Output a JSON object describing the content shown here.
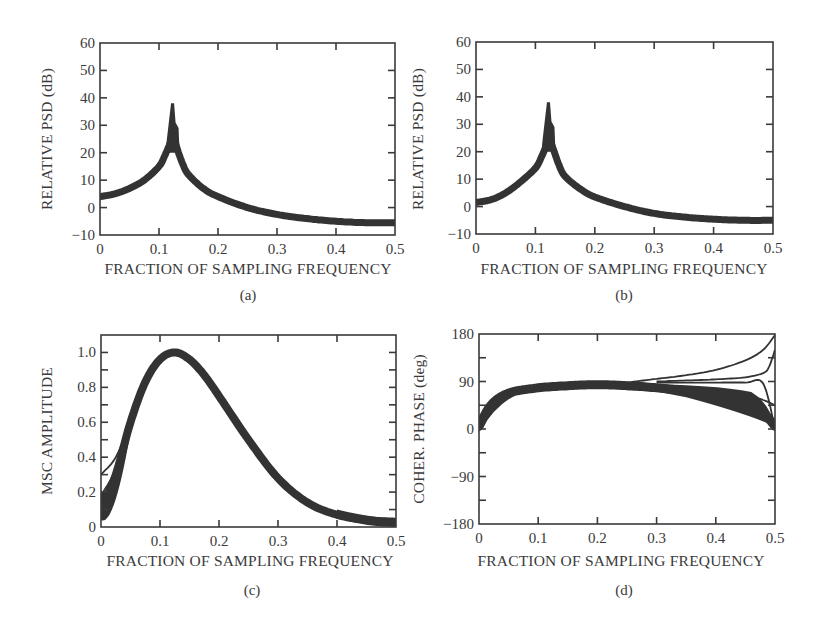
{
  "figure": {
    "panels": [
      {
        "id": "a",
        "caption": "(a)",
        "xlabel": "FRACTION OF SAMPLING FREQUENCY",
        "ylabel": "RELATIVE PSD (dB)"
      },
      {
        "id": "b",
        "caption": "(b)",
        "xlabel": "FRACTION OF SAMPLING FREQUENCY",
        "ylabel": "RELATIVE PSD (dB)"
      },
      {
        "id": "c",
        "caption": "(c)",
        "xlabel": "FRACTION OF SAMPLING FREQUENCY",
        "ylabel": "MSC AMPLITUDE"
      },
      {
        "id": "d",
        "caption": "(d)",
        "xlabel": "FRACTION OF SAMPLING FREQUENCY",
        "ylabel": "COHER. PHASE (deg)"
      }
    ],
    "colors": {
      "ink": "#2b2b2b",
      "band": "#333333",
      "axis": "#3a3a3a",
      "background": "#ffffff"
    }
  },
  "chart_data": [
    {
      "panel": "a",
      "type": "line",
      "title": "",
      "xlabel": "FRACTION OF SAMPLING FREQUENCY",
      "ylabel": "RELATIVE PSD (dB)",
      "caption": "(a)",
      "xlim": [
        0,
        0.5
      ],
      "ylim": [
        -10,
        60
      ],
      "xticks": [
        0,
        0.1,
        0.2,
        0.3,
        0.4,
        0.5
      ],
      "xtick_labels": [
        "0",
        "0.1",
        "0.2",
        "0.3",
        "0.4",
        "0.5"
      ],
      "yticks": [
        -10,
        0,
        10,
        20,
        30,
        40,
        50,
        60
      ],
      "ytick_labels": [
        "−10",
        "0",
        "10",
        "20",
        "30",
        "40",
        "50",
        "60"
      ],
      "grid": false,
      "description": "Ensemble of overlaid PSD estimates forming a dense band; resonant peak near 0.125",
      "series": [
        {
          "name": "ensemble-center",
          "x": [
            0,
            0.025,
            0.05,
            0.075,
            0.1,
            0.11,
            0.12,
            0.125,
            0.13,
            0.14,
            0.15,
            0.175,
            0.2,
            0.25,
            0.3,
            0.35,
            0.4,
            0.45,
            0.5
          ],
          "y": [
            4,
            5,
            7,
            10,
            15,
            19,
            24,
            26,
            22,
            16,
            12,
            7,
            4,
            0,
            -2.5,
            -4,
            -5,
            -5.5,
            -5.5
          ]
        },
        {
          "name": "ensemble-peak-max",
          "x": [
            0.123
          ],
          "y": [
            38
          ]
        }
      ]
    },
    {
      "panel": "b",
      "type": "line",
      "title": "",
      "xlabel": "FRACTION OF SAMPLING FREQUENCY",
      "ylabel": "RELATIVE PSD (dB)",
      "caption": "(b)",
      "xlim": [
        0,
        0.5
      ],
      "ylim": [
        -10,
        60
      ],
      "xticks": [
        0,
        0.1,
        0.2,
        0.3,
        0.4,
        0.5
      ],
      "xtick_labels": [
        "0",
        "0.1",
        "0.2",
        "0.3",
        "0.4",
        "0.5"
      ],
      "yticks": [
        -10,
        0,
        10,
        20,
        30,
        40,
        50,
        60
      ],
      "ytick_labels": [
        "−10",
        "0",
        "10",
        "20",
        "30",
        "40",
        "50",
        "60"
      ],
      "grid": false,
      "description": "Ensemble of overlaid PSD estimates forming a dense band; resonant peak near 0.123",
      "series": [
        {
          "name": "ensemble-center",
          "x": [
            0,
            0.025,
            0.05,
            0.075,
            0.1,
            0.11,
            0.12,
            0.123,
            0.13,
            0.14,
            0.15,
            0.175,
            0.2,
            0.25,
            0.3,
            0.35,
            0.4,
            0.45,
            0.5
          ],
          "y": [
            1.5,
            2.5,
            5,
            9,
            14,
            18,
            23,
            25,
            21,
            15,
            11,
            6.5,
            3.5,
            0,
            -2.5,
            -3.8,
            -4.6,
            -5,
            -5
          ]
        },
        {
          "name": "ensemble-peak-max",
          "x": [
            0.122
          ],
          "y": [
            38
          ]
        }
      ]
    },
    {
      "panel": "c",
      "type": "line",
      "title": "",
      "xlabel": "FRACTION OF SAMPLING FREQUENCY",
      "ylabel": "MSC AMPLITUDE",
      "caption": "(c)",
      "xlim": [
        0,
        0.5
      ],
      "ylim": [
        0,
        1.1
      ],
      "xticks": [
        0,
        0.1,
        0.2,
        0.3,
        0.4,
        0.5
      ],
      "xtick_labels": [
        "0",
        "0.1",
        "0.2",
        "0.3",
        "0.4",
        "0.5"
      ],
      "yticks": [
        0,
        0.2,
        0.4,
        0.6,
        0.8,
        1.0
      ],
      "ytick_labels": [
        "0",
        "0.2",
        "0.4",
        "0.6",
        "0.8",
        "1.0"
      ],
      "minor_yticks": [
        0.1,
        0.3,
        0.5,
        0.7,
        0.9
      ],
      "grid": false,
      "description": "Magnitude-squared coherence ensemble; band peaks at 1.0 near 0.125; separate curves diverge at low frequency (start values ~0.05 to 0.3)",
      "series": [
        {
          "name": "ensemble-center",
          "x": [
            0,
            0.025,
            0.05,
            0.075,
            0.1,
            0.125,
            0.15,
            0.175,
            0.2,
            0.25,
            0.3,
            0.35,
            0.4,
            0.45,
            0.5
          ],
          "y": [
            0.1,
            0.3,
            0.6,
            0.83,
            0.96,
            1.0,
            0.96,
            0.87,
            0.75,
            0.5,
            0.28,
            0.14,
            0.07,
            0.04,
            0.03
          ]
        },
        {
          "name": "outlier-high-start",
          "x": [
            0,
            0.025,
            0.05,
            0.075
          ],
          "y": [
            0.3,
            0.4,
            0.6,
            0.83
          ]
        },
        {
          "name": "outlier-mid-start",
          "x": [
            0,
            0.025,
            0.05,
            0.075
          ],
          "y": [
            0.18,
            0.33,
            0.58,
            0.82
          ]
        }
      ]
    },
    {
      "panel": "d",
      "type": "line",
      "title": "",
      "xlabel": "FRACTION OF SAMPLING FREQUENCY",
      "ylabel": "COHER. PHASE (deg)",
      "caption": "(d)",
      "xlim": [
        0,
        0.5
      ],
      "ylim": [
        -180,
        180
      ],
      "xticks": [
        0,
        0.1,
        0.2,
        0.3,
        0.4,
        0.5
      ],
      "xtick_labels": [
        "0",
        "0.1",
        "0.2",
        "0.3",
        "0.4",
        "0.5"
      ],
      "yticks": [
        -180,
        -90,
        0,
        90,
        180
      ],
      "ytick_labels": [
        "−180",
        "−90",
        "0",
        "90",
        "180"
      ],
      "minor_yticks": [
        -135,
        -45,
        45,
        135
      ],
      "grid": false,
      "description": "Coherence phase ensemble; rises from 0 to ~85 deg, fans out near 0.5 with curves ending at 180, ~150, 90, 45 and 0 deg",
      "series": [
        {
          "name": "ensemble-center",
          "x": [
            0,
            0.02,
            0.05,
            0.1,
            0.15,
            0.2,
            0.25,
            0.3,
            0.35,
            0.4,
            0.45,
            0.48,
            0.5
          ],
          "y": [
            5,
            45,
            68,
            78,
            82,
            84,
            82,
            78,
            72,
            62,
            45,
            30,
            5
          ]
        },
        {
          "name": "upper-to-180",
          "x": [
            0.25,
            0.3,
            0.35,
            0.4,
            0.45,
            0.48,
            0.5
          ],
          "y": [
            88,
            95,
            102,
            112,
            130,
            150,
            178
          ]
        },
        {
          "name": "upper-to-150",
          "x": [
            0.3,
            0.35,
            0.4,
            0.45,
            0.48,
            0.49,
            0.5
          ],
          "y": [
            90,
            92,
            94,
            98,
            106,
            118,
            150
          ]
        },
        {
          "name": "flat-90",
          "x": [
            0.3,
            0.4,
            0.45,
            0.48,
            0.5
          ],
          "y": [
            88,
            88,
            88,
            86,
            0
          ]
        },
        {
          "name": "lower-to-45",
          "x": [
            0.3,
            0.4,
            0.45,
            0.48,
            0.5
          ],
          "y": [
            80,
            75,
            65,
            55,
            45
          ]
        }
      ]
    }
  ]
}
